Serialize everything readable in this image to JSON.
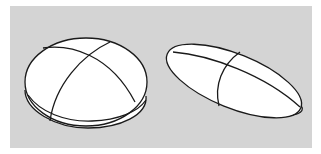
{
  "figure": {
    "background_color": "#d4d4d4",
    "shape_fill": "#ffffff",
    "stroke_color": "#1a1a1a",
    "shapes": [
      {
        "name": "round-ellipsoid",
        "description": "oblate rounded ellipsoid with two crossing seam lines"
      },
      {
        "name": "elongated-ellipsoid",
        "description": "elongated tilted ellipsoid with two crossing seam lines"
      }
    ]
  }
}
